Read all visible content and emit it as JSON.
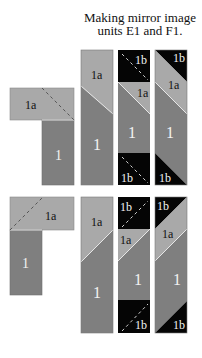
{
  "title": {
    "line1": "Making mirror image",
    "line2": "units E1 and F1."
  },
  "colors": {
    "light_gray": "#a9a9a9",
    "dark_gray": "#7f7f7f",
    "black": "#050505",
    "seam": "#e6e6e6",
    "label_dark": "#111111",
    "label_light": "#f2f2f2"
  },
  "labels": {
    "piece_1": "1",
    "piece_1a": "1a",
    "piece_1b": "1b"
  },
  "rows": [
    {
      "name": "E1",
      "steps": [
        "L-shape 1 + 1a",
        "strip 1 + 1a",
        "strip 1b + 1a + 1 + 1b",
        "finished unit"
      ]
    },
    {
      "name": "F1",
      "steps": [
        "L-shape 1 + 1a",
        "strip 1 + 1a",
        "strip 1b + 1a + 1 + 1b",
        "finished unit"
      ]
    }
  ]
}
